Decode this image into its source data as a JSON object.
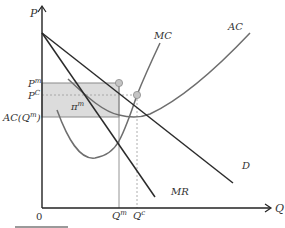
{
  "diagram": {
    "axes": {
      "y_label": "P",
      "x_label": "Q",
      "origin_label": "0"
    },
    "price_labels": {
      "p_monopoly": "P",
      "p_monopoly_sup": "m",
      "p_competitive": "P",
      "p_competitive_sup": "C",
      "ac_qm": "AC(Q",
      "ac_qm_sup": "m",
      "ac_qm_close": ")"
    },
    "quantity_labels": {
      "q_monopoly": "Q",
      "q_monopoly_sup": "m",
      "q_competitive": "Q",
      "q_competitive_sup": "c"
    },
    "curves": {
      "mc": "MC",
      "ac": "AC",
      "demand": "D",
      "mr": "MR"
    },
    "profit_area": {
      "label": "π",
      "label_sup": "m"
    },
    "colors": {
      "axis": "#222222",
      "demand_mr": "#2b2b2b",
      "cost_curves": "#6e6e6e",
      "profit_fill": "#dcdcdc",
      "point_fill": "#c4c4c4",
      "guide": "#888888"
    }
  }
}
